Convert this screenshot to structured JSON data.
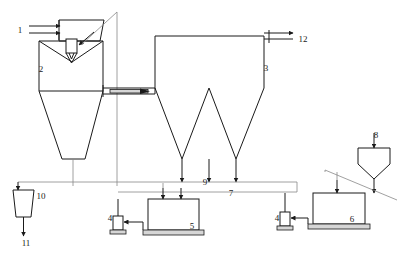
{
  "diagram": {
    "background_color": "#ffffff",
    "line_color": "#1a1a1a",
    "accent_color": "#d6d6d6",
    "labels": [
      {
        "id": "1",
        "text": "1",
        "x": 20,
        "y": 33,
        "role": "inlet-feed"
      },
      {
        "id": "2",
        "text": "2",
        "x": 41,
        "y": 72,
        "role": "reactor-vessel"
      },
      {
        "id": "3",
        "text": "3",
        "x": 266,
        "y": 71,
        "role": "baghouse-vessel"
      },
      {
        "id": "4a",
        "text": "4",
        "x": 110,
        "y": 221,
        "role": "pump-left"
      },
      {
        "id": "5",
        "text": "5",
        "x": 192,
        "y": 229,
        "role": "tank-left"
      },
      {
        "id": "4b",
        "text": "4",
        "x": 277,
        "y": 221,
        "role": "pump-right"
      },
      {
        "id": "6",
        "text": "6",
        "x": 352,
        "y": 222,
        "role": "tank-right"
      },
      {
        "id": "7",
        "text": "7",
        "x": 231,
        "y": 196,
        "role": "line-lower"
      },
      {
        "id": "8",
        "text": "8",
        "x": 376,
        "y": 138,
        "role": "hopper-right"
      },
      {
        "id": "9",
        "text": "9",
        "x": 205,
        "y": 185,
        "role": "line-upper"
      },
      {
        "id": "10",
        "text": "10",
        "x": 37,
        "y": 199,
        "role": "hopper-left"
      },
      {
        "id": "11",
        "text": "11",
        "x": 25,
        "y": 246,
        "role": "outlet-bottom"
      },
      {
        "id": "12",
        "text": "12",
        "x": 301,
        "y": 42,
        "role": "gas-outlet"
      }
    ],
    "components": {
      "inlet_feed": {
        "name": "inlet-feed",
        "label": "1"
      },
      "reactor": {
        "name": "reactor-vessel",
        "label": "2"
      },
      "nozzle": {
        "name": "spray-nozzle"
      },
      "baghouse": {
        "name": "baghouse-vessel",
        "label": "3"
      },
      "gas_outlet": {
        "name": "gas-outlet",
        "label": "12"
      },
      "pump_left": {
        "name": "pump-left",
        "label": "4"
      },
      "pump_right": {
        "name": "pump-right",
        "label": "4"
      },
      "tank_left": {
        "name": "tank-left",
        "label": "5"
      },
      "tank_right": {
        "name": "tank-right",
        "label": "6"
      },
      "line_upper": {
        "name": "line-upper",
        "label": "9"
      },
      "line_lower": {
        "name": "line-lower",
        "label": "7"
      },
      "hopper_right": {
        "name": "hopper-right",
        "label": "8"
      },
      "hopper_left": {
        "name": "hopper-left",
        "label": "10"
      },
      "outlet_bottom": {
        "name": "outlet-bottom",
        "label": "11"
      }
    }
  }
}
